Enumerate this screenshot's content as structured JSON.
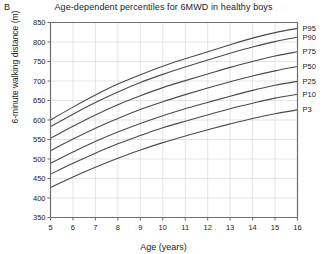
{
  "panel": {
    "label": "B"
  },
  "chart_data": {
    "type": "line",
    "title": "Age-dependent percentiles for 6MWD in healthy boys",
    "xlabel": "Age (years)",
    "ylabel": "6-minute walking distance (m)",
    "xlim": [
      5,
      16
    ],
    "ylim": [
      350,
      850
    ],
    "xticks": [
      5,
      6,
      7,
      8,
      9,
      10,
      11,
      12,
      13,
      14,
      15,
      16
    ],
    "yticks": [
      350,
      400,
      450,
      500,
      550,
      600,
      650,
      700,
      750,
      800,
      850
    ],
    "grid": true,
    "legend_position": "right-inline",
    "x": [
      5,
      6,
      7,
      8,
      9,
      10,
      11,
      12,
      13,
      14,
      15,
      16
    ],
    "series": [
      {
        "name": "P95",
        "values": [
          600,
          633,
          664,
          692,
          716,
          738,
          757,
          775,
          793,
          810,
          824,
          835
        ]
      },
      {
        "name": "P90",
        "values": [
          583,
          615,
          645,
          672,
          696,
          717,
          736,
          754,
          771,
          787,
          801,
          812
        ]
      },
      {
        "name": "P75",
        "values": [
          553,
          584,
          613,
          639,
          662,
          683,
          701,
          718,
          735,
          750,
          764,
          775
        ]
      },
      {
        "name": "P50",
        "values": [
          521,
          551,
          579,
          604,
          627,
          647,
          665,
          682,
          698,
          713,
          726,
          737
        ]
      },
      {
        "name": "P25",
        "values": [
          489,
          518,
          545,
          569,
          591,
          611,
          629,
          645,
          661,
          676,
          689,
          699
        ]
      },
      {
        "name": "P10",
        "values": [
          461,
          489,
          515,
          539,
          560,
          580,
          597,
          613,
          629,
          643,
          656,
          666
        ]
      },
      {
        "name": "P3",
        "values": [
          427,
          454,
          479,
          502,
          523,
          542,
          559,
          575,
          590,
          604,
          616,
          626
        ]
      }
    ],
    "colors": {
      "line": "#4a4a4a",
      "grid": "#d9d9d9",
      "axis": "#6e6e6e"
    }
  }
}
